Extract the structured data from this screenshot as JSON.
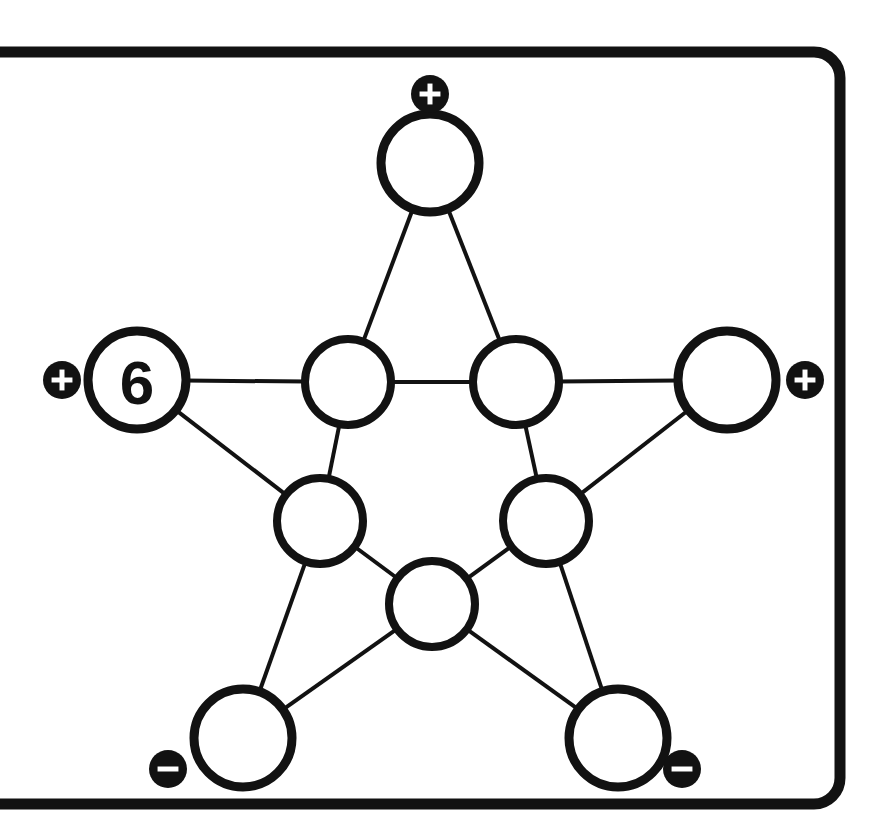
{
  "page": {
    "background_color": "#ffffff",
    "ink_color": "#121212",
    "width": 870,
    "height": 827
  },
  "frame": {
    "name": "rounded-board-frame",
    "x": -40,
    "y": 52,
    "width": 880,
    "height": 752,
    "corner_radius": 26,
    "stroke_width": 11
  },
  "diagram": {
    "type": "pentagram-node-graph",
    "node_count": 10,
    "edge_count": 10,
    "outer_radius": 49,
    "inner_radius": 43
  },
  "nodes": [
    {
      "id": "top",
      "label": "top-point-node",
      "value": "",
      "cx": 430,
      "cy": 163,
      "r": 49,
      "ring": "outer"
    },
    {
      "id": "left",
      "label": "left-point-node",
      "value": "6",
      "cx": 137,
      "cy": 380,
      "r": 49,
      "ring": "outer"
    },
    {
      "id": "right",
      "label": "right-point-node",
      "value": "",
      "cx": 727,
      "cy": 380,
      "r": 49,
      "ring": "outer"
    },
    {
      "id": "bottom-left",
      "label": "bottom-left-point-node",
      "value": "",
      "cx": 243,
      "cy": 738,
      "r": 49,
      "ring": "outer"
    },
    {
      "id": "bottom-right",
      "label": "bottom-right-point-node",
      "value": "",
      "cx": 618,
      "cy": 738,
      "r": 49,
      "ring": "outer"
    },
    {
      "id": "inner-top-left",
      "label": "inner-upper-left-node",
      "value": "",
      "cx": 348,
      "cy": 382,
      "r": 43,
      "ring": "inner"
    },
    {
      "id": "inner-top-right",
      "label": "inner-upper-right-node",
      "value": "",
      "cx": 516,
      "cy": 382,
      "r": 43,
      "ring": "inner"
    },
    {
      "id": "inner-left",
      "label": "inner-left-node",
      "value": "",
      "cx": 320,
      "cy": 521,
      "r": 43,
      "ring": "inner"
    },
    {
      "id": "inner-right",
      "label": "inner-right-node",
      "value": "",
      "cx": 546,
      "cy": 521,
      "r": 43,
      "ring": "inner"
    },
    {
      "id": "inner-bottom",
      "label": "inner-bottom-node",
      "value": "",
      "cx": 432,
      "cy": 604,
      "r": 43,
      "ring": "inner"
    }
  ],
  "edges": [
    {
      "from": "top",
      "to": "inner-top-left",
      "name": "edge-top-to-inner-upper-left"
    },
    {
      "from": "top",
      "to": "inner-top-right",
      "name": "edge-top-to-inner-upper-right"
    },
    {
      "from": "left",
      "to": "inner-top-left",
      "name": "edge-left-to-inner-upper-left"
    },
    {
      "from": "left",
      "to": "inner-left",
      "name": "edge-left-to-inner-left"
    },
    {
      "from": "right",
      "to": "inner-top-right",
      "name": "edge-right-to-inner-upper-right"
    },
    {
      "from": "right",
      "to": "inner-right",
      "name": "edge-right-to-inner-right"
    },
    {
      "from": "bottom-left",
      "to": "inner-left",
      "name": "edge-bottom-left-to-inner-left"
    },
    {
      "from": "bottom-left",
      "to": "inner-bottom",
      "name": "edge-bottom-left-to-inner-bottom"
    },
    {
      "from": "bottom-right",
      "to": "inner-right",
      "name": "edge-bottom-right-to-inner-right"
    },
    {
      "from": "bottom-right",
      "to": "inner-bottom",
      "name": "edge-bottom-right-to-inner-bottom"
    },
    {
      "from": "inner-top-left",
      "to": "inner-top-right",
      "name": "edge-inner-upper-left-to-inner-upper-right"
    },
    {
      "from": "inner-top-left",
      "to": "inner-left",
      "name": "edge-inner-upper-left-to-inner-left"
    },
    {
      "from": "inner-top-right",
      "to": "inner-right",
      "name": "edge-inner-upper-right-to-inner-right"
    },
    {
      "from": "inner-left",
      "to": "inner-bottom",
      "name": "edge-inner-left-to-inner-bottom"
    },
    {
      "from": "inner-right",
      "to": "inner-bottom",
      "name": "edge-inner-right-to-inner-bottom"
    }
  ],
  "badges": [
    {
      "id": "badge-top",
      "symbol": "plus",
      "glyph": "+",
      "cx": 430,
      "cy": 94,
      "r": 19,
      "attached_to": "top"
    },
    {
      "id": "badge-left",
      "symbol": "plus",
      "glyph": "+",
      "cx": 62,
      "cy": 380,
      "r": 19,
      "attached_to": "left"
    },
    {
      "id": "badge-right",
      "symbol": "plus",
      "glyph": "+",
      "cx": 805,
      "cy": 380,
      "r": 19,
      "attached_to": "right"
    },
    {
      "id": "badge-bottom-left",
      "symbol": "minus",
      "glyph": "−",
      "cx": 168,
      "cy": 769,
      "r": 19,
      "attached_to": "bottom-left"
    },
    {
      "id": "badge-bottom-right",
      "symbol": "minus",
      "glyph": "−",
      "cx": 682,
      "cy": 769,
      "r": 19,
      "attached_to": "bottom-right"
    }
  ],
  "legend": {
    "plus_meaning": "plus-marker",
    "minus_meaning": "minus-marker"
  }
}
